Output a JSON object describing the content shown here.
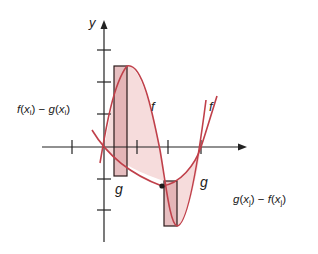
{
  "diagram": {
    "axis_labels": {
      "y": "y"
    },
    "curve_labels": {
      "f_upper": "f",
      "f_right": "f",
      "g_lower": "g",
      "g_right": "g"
    },
    "annotations": {
      "left_rect": "f(x i) − g(x i)",
      "right_rect": "g(x j) − f(x j)"
    },
    "colors": {
      "curve": "#c0404a",
      "fill": "#f6dcdc",
      "rect_fill": "#dea8ab",
      "axis": "#222222"
    }
  }
}
